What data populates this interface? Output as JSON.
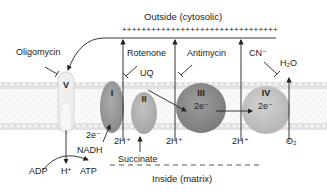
{
  "diagram": {
    "regions": {
      "outside_label": "Outside (cytosolic)",
      "inside_label": "Inside (matrix)",
      "outside_charge": "++++++++++++++++++++++++++++++++"
    },
    "complexes": [
      {
        "id": "V",
        "label": "V"
      },
      {
        "id": "I",
        "label": "I"
      },
      {
        "id": "II",
        "label": "II"
      },
      {
        "id": "III",
        "label": "III",
        "electron_label": "2e⁻"
      },
      {
        "id": "IV",
        "label": "IV",
        "electron_label": "2e⁻"
      }
    ],
    "inhibitors": {
      "oligomycin": "Oligomycin",
      "rotenone": "Rotenone",
      "antimycin": "Antimycin",
      "cyanide": "CN⁻"
    },
    "carriers": {
      "ubiquinone": "UQ"
    },
    "labels": {
      "electrons_I": "2e⁻",
      "nadh": "NADH",
      "succinate": "Succinate",
      "proton_I": "2H⁺",
      "proton_III": "2H⁺",
      "proton_IV": "2H⁺",
      "adp": "ADP",
      "h_plus": "H⁺",
      "atp": "ATP",
      "water": "H₂O",
      "oxygen": "O₂"
    },
    "colors": {
      "membrane": "#d9d9d9",
      "complex_V": "#ececec",
      "complex_I": "#9a9a9a",
      "complex_II": "#b5b5b5",
      "complex_III": "#8a8a8a",
      "complex_IV": "#c4c4c4",
      "line": "#222222"
    }
  }
}
